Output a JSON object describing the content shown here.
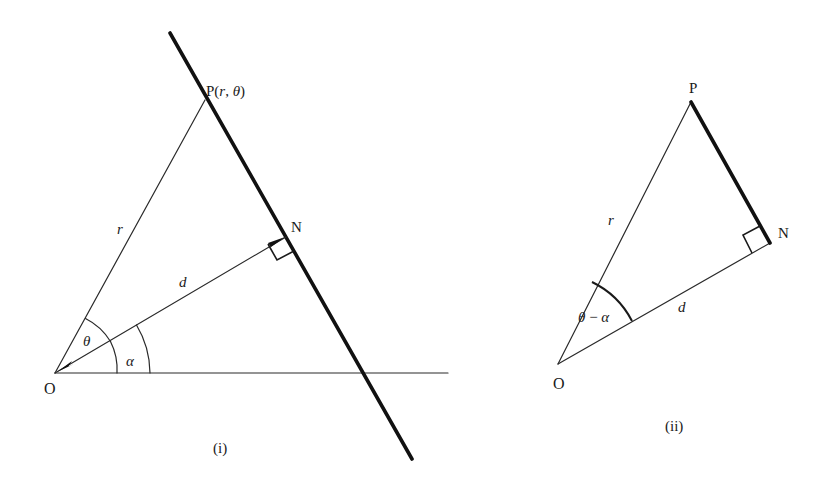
{
  "figure": {
    "panel_i": {
      "caption": "(i)",
      "points": {
        "origin_label": "O",
        "point_p_label": "P",
        "point_p_coords_open": "(",
        "point_p_r": "r",
        "point_p_sep": ", ",
        "point_p_theta": "θ",
        "point_p_coords_close": ")",
        "foot_label": "N"
      },
      "segments": {
        "op_label": "r",
        "on_label": "d"
      },
      "angles": {
        "theta_label": "θ",
        "alpha_label": "α"
      },
      "elements": [
        "initial line from O (horizontal)",
        "thick straight line through P and N",
        "segment OP of length r",
        "perpendicular ON of length d with right-angle mark at N",
        "angle θ between initial line and OP",
        "angle α between initial line and ON"
      ]
    },
    "panel_ii": {
      "caption": "(ii)",
      "points": {
        "origin_label": "O",
        "point_p_label": "P",
        "foot_label": "N"
      },
      "segments": {
        "op_label": "r",
        "on_label": "d"
      },
      "angles": {
        "theta_minus_alpha_theta": "θ",
        "theta_minus_alpha_minus": " − ",
        "theta_minus_alpha_alpha": "α"
      },
      "elements": [
        "right triangle OPN with right angle at N",
        "hypotenuse OP of length r",
        "side ON of length d",
        "thick side PN",
        "angle θ − α at O"
      ]
    }
  }
}
